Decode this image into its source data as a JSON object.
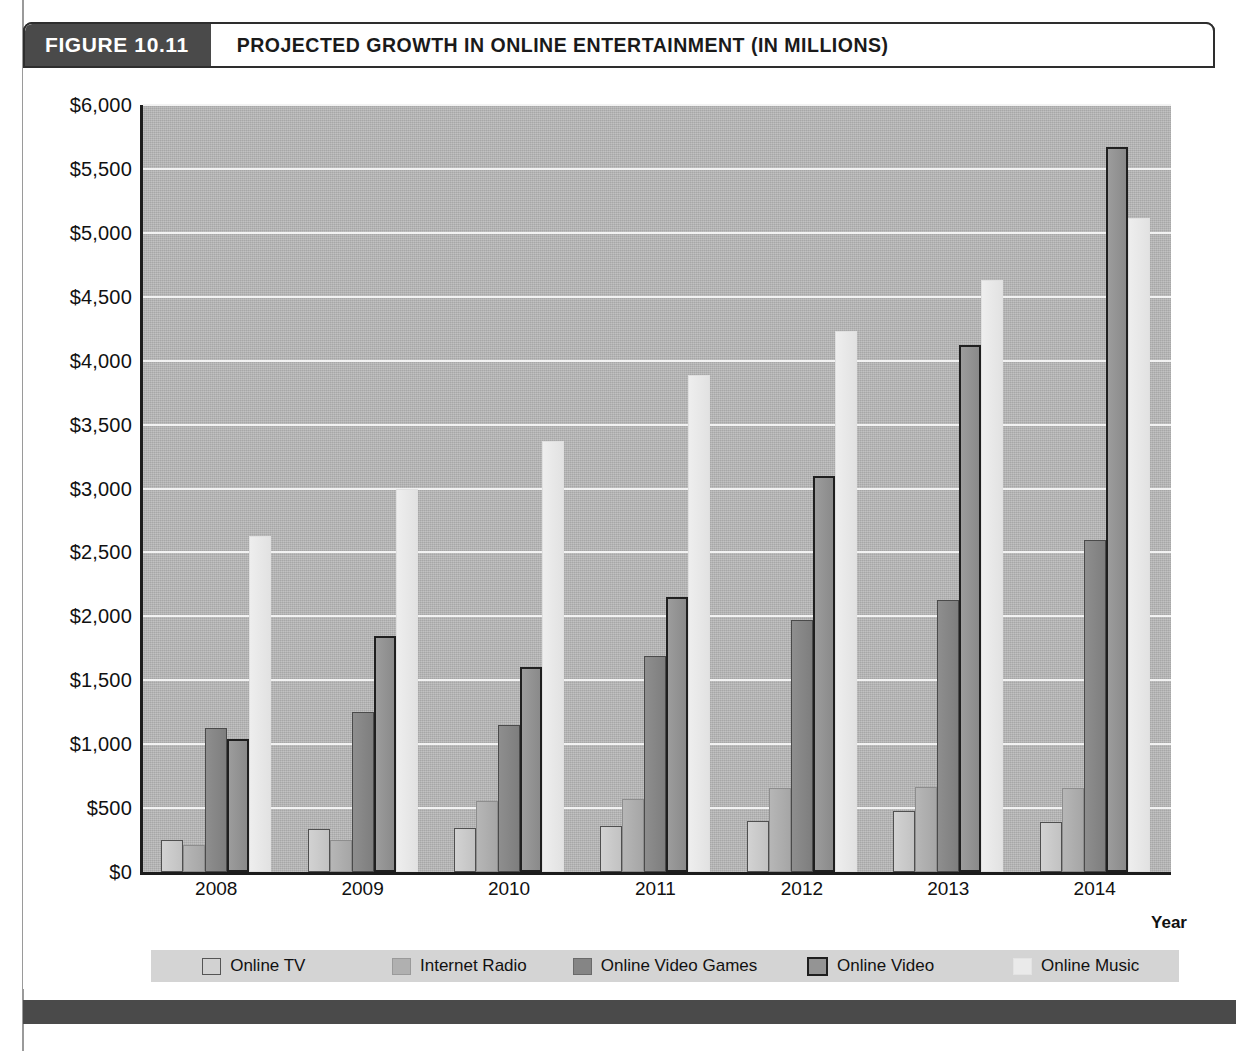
{
  "figure": {
    "number_label": "FIGURE 10.11",
    "title": "PROJECTED GROWTH IN ONLINE ENTERTAINMENT (IN MILLIONS)"
  },
  "axis": {
    "x_title": "Year",
    "y_ticks": [
      "$6,000",
      "$5,500",
      "$5,000",
      "$4,500",
      "$4,000",
      "$3,500",
      "$3,000",
      "$2,500",
      "$2,000",
      "$1,500",
      "$1,000",
      "$500",
      "$0"
    ]
  },
  "legend": {
    "items": [
      {
        "label": "Online TV",
        "color": "#d2d2d2"
      },
      {
        "label": "Internet Radio",
        "color": "#b0b0b0"
      },
      {
        "label": "Online Video Games",
        "color": "#858585"
      },
      {
        "label": "Online Video",
        "color": "#949494"
      },
      {
        "label": "Online Music",
        "color": "#eaeaea"
      }
    ]
  },
  "colors": {
    "header_block": "#4a4a4a",
    "plot_background": "#b4b4b4",
    "gridline": "#f2f2f2",
    "axis": "#1c1c1c",
    "legend_background": "#d4d4d4",
    "footer_bar": "#4a4a4a"
  },
  "chart_data": {
    "type": "bar",
    "title": "PROJECTED GROWTH IN ONLINE ENTERTAINMENT (IN MILLIONS)",
    "xlabel": "Year",
    "ylabel": "",
    "ylim": [
      0,
      6000
    ],
    "ytick_step": 500,
    "grid": true,
    "legend_position": "bottom",
    "currency_prefix": "$",
    "categories": [
      "2008",
      "2009",
      "2010",
      "2011",
      "2012",
      "2013",
      "2014"
    ],
    "series": [
      {
        "name": "Online TV",
        "values": [
          250,
          340,
          345,
          360,
          400,
          480,
          390
        ]
      },
      {
        "name": "Internet Radio",
        "values": [
          210,
          250,
          555,
          575,
          655,
          665,
          660
        ]
      },
      {
        "name": "Online Video Games",
        "values": [
          1130,
          1255,
          1150,
          1690,
          1975,
          2130,
          2600
        ]
      },
      {
        "name": "Online Video",
        "values": [
          1040,
          1845,
          1600,
          2150,
          3100,
          4125,
          5670
        ]
      },
      {
        "name": "Online Music",
        "values": [
          2630,
          3000,
          3370,
          3890,
          4230,
          4630,
          5120
        ]
      }
    ]
  }
}
